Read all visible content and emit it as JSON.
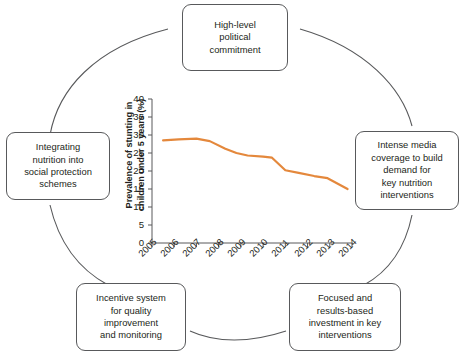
{
  "figure": {
    "title": "",
    "accent_color": "#e4883c",
    "box_border_color": "#58595b",
    "arc_color": "#58595b",
    "text_color": "#231f20"
  },
  "cycle": {
    "nodes": [
      {
        "id": "high-level-political-commitment",
        "position": "top",
        "lines": [
          "High-level",
          "political",
          "commitment"
        ]
      },
      {
        "id": "intense-media-coverage",
        "position": "right",
        "lines": [
          "Intense media",
          "coverage to build",
          "demand for",
          "key nutrition",
          "interventions"
        ]
      },
      {
        "id": "focused-results-based-investment",
        "position": "bottom-right",
        "lines": [
          "Focused and",
          "results-based",
          "investment in key",
          "interventions"
        ]
      },
      {
        "id": "incentive-system-quality",
        "position": "bottom-left",
        "lines": [
          "Incentive system",
          "for quality",
          "improvement",
          "and monitoring"
        ]
      },
      {
        "id": "integrating-nutrition-social-protection",
        "position": "left",
        "lines": [
          "Integrating",
          "nutrition into",
          "social protection",
          "schemes"
        ]
      }
    ]
  },
  "chart_data": {
    "type": "line",
    "title": "",
    "xlabel": "",
    "ylabel_lines": [
      "Prevalence of stunting in",
      "children under 5 years (%)"
    ],
    "ylabel": "Prevalence of stunting in children under 5 years (%)",
    "grid": false,
    "legend": "none",
    "xlim": [
      2005,
      2014
    ],
    "ylim": [
      0,
      40
    ],
    "ytick_labels": [
      "40",
      "35",
      "30",
      "25",
      "20",
      "15",
      "10",
      "5",
      "0"
    ],
    "ytick_values": [
      40,
      35,
      30,
      25,
      20,
      15,
      10,
      5,
      0
    ],
    "xtick_labels": [
      "2005",
      "2006",
      "2007",
      "2008",
      "2009",
      "2010",
      "2011",
      "2012",
      "2013",
      "2014"
    ],
    "xtick_values": [
      2005,
      2006,
      2007,
      2008,
      2009,
      2010,
      2011,
      2012,
      2013,
      2014
    ],
    "series": [
      {
        "name": "Prevalence of stunting in children under 5 years (%)",
        "color": "#e4883c",
        "x": [
          2005.5,
          2006.2,
          2007.0,
          2007.6,
          2008.3,
          2008.8,
          2009.3,
          2010.0,
          2010.4,
          2011.0,
          2011.6,
          2012.3,
          2012.9,
          2013.8
        ],
        "values": [
          28.5,
          28.8,
          29.0,
          28.3,
          26.2,
          25.0,
          24.3,
          24.0,
          23.7,
          20.2,
          19.5,
          18.6,
          18.0,
          15.0
        ]
      }
    ]
  }
}
